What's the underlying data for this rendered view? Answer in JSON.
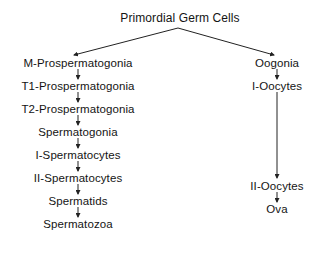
{
  "diagram": {
    "root": {
      "label": "Primordial Germ Cells"
    },
    "male_lineage": [
      {
        "label": "M-Prospermatogonia"
      },
      {
        "label": "T1-Prospermatogonia"
      },
      {
        "label": "T2-Prospermatogonia"
      },
      {
        "label": "Spermatogonia"
      },
      {
        "label": "I-Spermatocytes"
      },
      {
        "label": "II-Spermatocytes"
      },
      {
        "label": "Spermatids"
      },
      {
        "label": "Spermatozoa"
      }
    ],
    "female_lineage": [
      {
        "label": "Oogonia"
      },
      {
        "label": "I-Oocytes"
      },
      {
        "label": "II-Oocytes"
      },
      {
        "label": "Ova"
      }
    ],
    "edges": [
      [
        "Primordial Germ Cells",
        "M-Prospermatogonia"
      ],
      [
        "Primordial Germ Cells",
        "Oogonia"
      ],
      [
        "M-Prospermatogonia",
        "T1-Prospermatogonia"
      ],
      [
        "T1-Prospermatogonia",
        "T2-Prospermatogonia"
      ],
      [
        "T2-Prospermatogonia",
        "Spermatogonia"
      ],
      [
        "Spermatogonia",
        "I-Spermatocytes"
      ],
      [
        "I-Spermatocytes",
        "II-Spermatocytes"
      ],
      [
        "II-Spermatocytes",
        "Spermatids"
      ],
      [
        "Spermatids",
        "Spermatozoa"
      ],
      [
        "Oogonia",
        "I-Oocytes"
      ],
      [
        "I-Oocytes",
        "II-Oocytes"
      ],
      [
        "II-Oocytes",
        "Ova"
      ]
    ]
  }
}
